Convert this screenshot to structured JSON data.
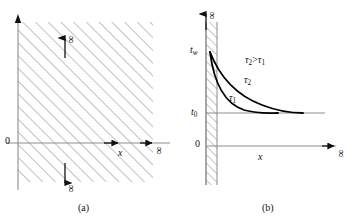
{
  "figure": {
    "type": "diagram",
    "panels": [
      {
        "caption": "(a)",
        "axes": {
          "origin_label": "0",
          "x_axis_label": "x",
          "x_axis_end_label": "∞",
          "up_arrow_label": "∞",
          "down_arrow_label": "∞"
        },
        "region": {
          "fill": "hatched",
          "hatch_angle_deg": 45
        }
      },
      {
        "caption": "(b)",
        "axes": {
          "origin_label": "0",
          "x_axis_label": "x",
          "x_axis_end_label": "∞",
          "y_axis_end_label": "∞"
        },
        "tick_labels": {
          "wall_temp": "t",
          "wall_temp_sub": "w",
          "ambient_temp": "t",
          "ambient_temp_sub": "0"
        },
        "annotations": [
          {
            "text": "τ₂ > τ₁",
            "base": "τ",
            "sub": "2",
            "rel": ">",
            "base2": "τ",
            "sub2": "1"
          }
        ],
        "curves": [
          {
            "label_base": "τ",
            "label_sub": "2",
            "name": "tau-2-curve"
          },
          {
            "label_base": "τ",
            "label_sub": "1",
            "name": "tau-1-curve"
          }
        ],
        "wall": {
          "fill": "hatched",
          "hatch_angle_deg": 45
        }
      }
    ],
    "colors": {
      "ink": "#111111",
      "axis": "#8a8a8a",
      "hatch": "#8a8a8a",
      "curve": "#000000"
    }
  }
}
